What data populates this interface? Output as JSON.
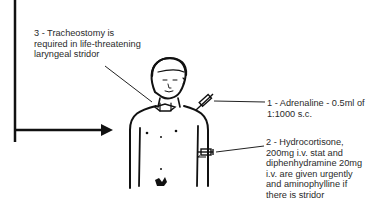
{
  "diagram": {
    "annotations": [
      {
        "id": "tracheostomy",
        "text": "3 - Tracheostomy is required in life-threatening laryngeal stridor"
      },
      {
        "id": "adrenaline",
        "text": "1 - Adrenaline - 0.5ml of 1:1000 s.c."
      },
      {
        "id": "hydrocortisone",
        "text": "2 - Hydrocortisone, 200mg i.v. stat and diphenhydramine 20mg i.v. are given urgently and aminophylline if there is stridor"
      }
    ],
    "colors": {
      "ink": "#111111",
      "text": "#2a2a2a",
      "background": "#ffffff"
    }
  }
}
